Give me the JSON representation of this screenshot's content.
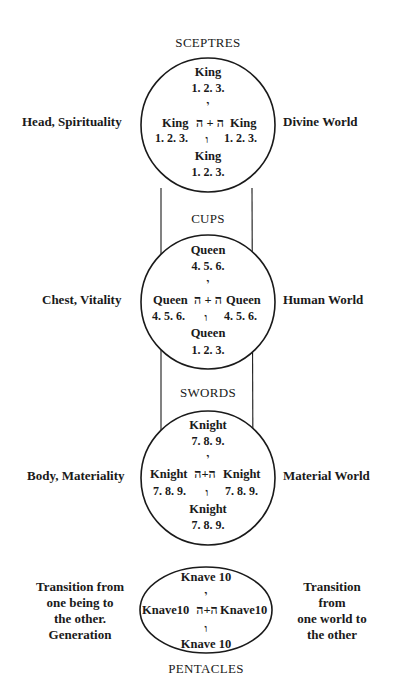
{
  "diagram": {
    "levels": [
      {
        "suit": "SCEPTRES",
        "figure": "King",
        "top_numbers": "1.  2.  3.",
        "middle_left": "King",
        "middle_right": "King",
        "middle_hebrew": "ה + ה",
        "left_numbers": "1. 2. 3.",
        "right_numbers": "1. 2. 3.",
        "bottom_figure": "King",
        "bottom_numbers": "1.  2.  3.",
        "yod": "י",
        "vav": "ו",
        "left_label": "Head, Spirituality",
        "right_label": "Divine World"
      },
      {
        "suit": "CUPS",
        "figure": "Queen",
        "top_numbers": "4.  5.  6.",
        "middle_left": "Queen",
        "middle_right": "Queen",
        "middle_hebrew": "ה + ה",
        "left_numbers": "4. 5. 6.",
        "right_numbers": "4. 5. 6.",
        "bottom_figure": "Queen",
        "bottom_numbers": "1.  2.  3.",
        "yod": "י",
        "vav": "ו",
        "left_label": "Chest, Vitality",
        "right_label": "Human World"
      },
      {
        "suit": "SWORDS",
        "figure": "Knight",
        "top_numbers": "7.  8.  9.",
        "middle_left": "Knight",
        "middle_right": "Knight",
        "middle_hebrew": "ה+ה",
        "left_numbers": "7. 8. 9.",
        "right_numbers": "7. 8. 9.",
        "bottom_figure": "Knight",
        "bottom_numbers": "7.  8.  9.",
        "yod": "י",
        "vav": "ו",
        "left_label": "Body, Materiality",
        "right_label": "Material World"
      },
      {
        "suit": "PENTACLES",
        "figure": "Knave 10",
        "middle_left": "Knave10",
        "middle_right": "Knave10",
        "middle_hebrew": "ה+ה",
        "bottom_figure": "Knave 10",
        "yod": "י",
        "vav": "ו",
        "left_label_lines": [
          "Transition from",
          "one being to",
          "the other.",
          "Generation"
        ],
        "right_label_lines": [
          "Transition from",
          "one world to",
          "the other"
        ]
      }
    ],
    "colors": {
      "ink": "#1a1a1a",
      "background": "#ffffff"
    }
  }
}
